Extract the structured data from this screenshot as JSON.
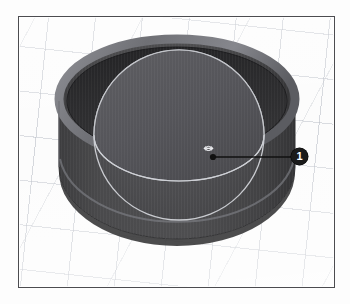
{
  "figure": {
    "kind": "cad-viewport-illustration",
    "background_color": "#fcfcfc",
    "frame_color": "#4c4c50",
    "grid_color": "#afb4be"
  },
  "scene": {
    "objects": [
      {
        "name": "cylinder",
        "role": "open-top-cylinder",
        "wall_color": "#474747",
        "interior_color": "#2b2b2b",
        "rim_highlight_color": "#8f9096",
        "outline_color": "#3a3a3a"
      },
      {
        "name": "sphere",
        "role": "translucent-sphere-inside-cylinder",
        "body_color": "#4a4a4c",
        "top_face_color": "#555558",
        "outline_color": "#c9cbd0"
      }
    ]
  },
  "callout": {
    "number": "1",
    "target_label": "sphere-surface",
    "leader_dot_color": "#111111",
    "leader_line_color": "#111111",
    "badge_fill": "#1a1a1a",
    "badge_text_color": "#ffffff"
  },
  "cursor": {
    "icon": "move-cursor-icon",
    "color": "#e6e7ea"
  }
}
